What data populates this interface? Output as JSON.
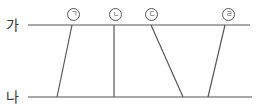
{
  "lines": {
    "top": {
      "label": "가"
    },
    "bottom": {
      "label": "나"
    }
  },
  "segments": [
    {
      "label": "ㄱ",
      "top_x": 72,
      "bottom_x": 57
    },
    {
      "label": "ㄴ",
      "top_x": 114,
      "bottom_x": 114
    },
    {
      "label": "ㄷ",
      "top_x": 151,
      "bottom_x": 183
    },
    {
      "label": "ㄹ",
      "top_x": 225,
      "bottom_x": 208
    }
  ]
}
